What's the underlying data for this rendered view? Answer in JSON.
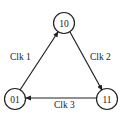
{
  "diagram": {
    "type": "state-transition",
    "nodes": [
      {
        "id": "n10",
        "label": "10",
        "cx": 64,
        "cy": 23
      },
      {
        "id": "n01",
        "label": "01",
        "cx": 15,
        "cy": 99
      },
      {
        "id": "n11",
        "label": "11",
        "cx": 107,
        "cy": 99
      }
    ],
    "edges": [
      {
        "from": "01",
        "to": "10",
        "label": "Clk 1"
      },
      {
        "from": "10",
        "to": "11",
        "label": "Clk 2"
      },
      {
        "from": "11",
        "to": "01",
        "label": "Clk 3"
      }
    ],
    "colors": {
      "stroke": "#222222",
      "background": "#ffffff"
    }
  }
}
